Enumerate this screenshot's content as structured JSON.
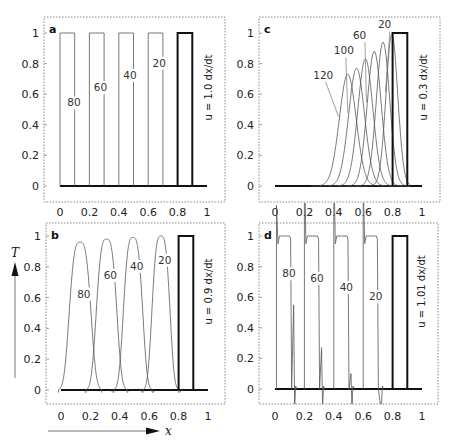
{
  "figure": {
    "y_axis_label": "T",
    "x_axis_label": "x"
  },
  "chart_data": [
    {
      "type": "line",
      "panel": "a",
      "title": "",
      "velocity_label": "u = 1.0 dx/dt",
      "xlabel": "x",
      "ylabel": "T",
      "xlim": [
        0,
        1
      ],
      "ylim": [
        -0.1,
        1.1
      ],
      "xticks": [
        0,
        0.2,
        0.4,
        0.6,
        0.8,
        1
      ],
      "yticks": [
        0,
        0.2,
        0.4,
        0.6,
        0.8,
        1
      ],
      "initial": {
        "shape": "box",
        "x0": 0.8,
        "x1": 0.9,
        "height": 1
      },
      "series": [
        {
          "name": "20",
          "shape": "box",
          "x0": 0.6,
          "x1": 0.7,
          "height": 1,
          "label_pos": [
            0.63,
            0.78
          ]
        },
        {
          "name": "40",
          "shape": "box",
          "x0": 0.4,
          "x1": 0.5,
          "height": 1,
          "label_pos": [
            0.43,
            0.7
          ]
        },
        {
          "name": "60",
          "shape": "box",
          "x0": 0.2,
          "x1": 0.3,
          "height": 1,
          "label_pos": [
            0.23,
            0.62
          ]
        },
        {
          "name": "80",
          "shape": "box",
          "x0": 0.0,
          "x1": 0.1,
          "height": 1,
          "label_pos": [
            0.05,
            0.52
          ]
        }
      ]
    },
    {
      "type": "line",
      "panel": "b",
      "velocity_label": "u = 0.9 dx/dt",
      "xlabel": "x",
      "ylabel": "T",
      "xlim": [
        0,
        1
      ],
      "ylim": [
        -0.1,
        1.1
      ],
      "xticks": [
        0,
        0.2,
        0.4,
        0.6,
        0.8,
        1
      ],
      "yticks": [
        0,
        0.2,
        0.4,
        0.6,
        0.8,
        1
      ],
      "initial": {
        "shape": "box",
        "x0": 0.8,
        "x1": 0.9,
        "height": 1
      },
      "series": [
        {
          "name": "20",
          "shape": "pulse",
          "center": 0.68,
          "width": 0.07,
          "height": 1.0,
          "label_pos": [
            0.66,
            0.82
          ]
        },
        {
          "name": "40",
          "shape": "pulse",
          "center": 0.49,
          "width": 0.075,
          "height": 0.99,
          "label_pos": [
            0.47,
            0.78
          ]
        },
        {
          "name": "60",
          "shape": "pulse",
          "center": 0.31,
          "width": 0.08,
          "height": 0.98,
          "label_pos": [
            0.29,
            0.72
          ]
        },
        {
          "name": "80",
          "shape": "pulse",
          "center": 0.13,
          "width": 0.085,
          "height": 0.96,
          "label_pos": [
            0.11,
            0.6
          ]
        }
      ]
    },
    {
      "type": "line",
      "panel": "c",
      "velocity_label": "u = 0.3 dx/dt",
      "xlabel": "x",
      "ylabel": "T",
      "xlim": [
        0,
        1
      ],
      "ylim": [
        -0.1,
        1.1
      ],
      "xticks": [
        0,
        0.2,
        0.4,
        0.6,
        0.8,
        1
      ],
      "yticks": [
        0,
        0.2,
        0.4,
        0.6,
        0.8,
        1
      ],
      "initial": {
        "shape": "box",
        "x0": 0.8,
        "x1": 0.9,
        "height": 1
      },
      "series": [
        {
          "name": "20",
          "shape": "gauss",
          "center": 0.795,
          "sigma": 0.04,
          "height": 0.99,
          "label_pos": [
            0.7,
            1.03
          ],
          "leader": true
        },
        {
          "name": "40",
          "shape": "gauss",
          "center": 0.735,
          "sigma": 0.045,
          "height": 0.94
        },
        {
          "name": "60",
          "shape": "gauss",
          "center": 0.675,
          "sigma": 0.048,
          "height": 0.88,
          "label_pos": [
            0.53,
            0.96
          ],
          "leader": true
        },
        {
          "name": "80",
          "shape": "gauss",
          "center": 0.615,
          "sigma": 0.051,
          "height": 0.83
        },
        {
          "name": "100",
          "shape": "gauss",
          "center": 0.555,
          "sigma": 0.054,
          "height": 0.77,
          "label_pos": [
            0.4,
            0.86
          ],
          "leader": true
        },
        {
          "name": "120",
          "shape": "gauss",
          "center": 0.495,
          "sigma": 0.057,
          "height": 0.73,
          "label_pos": [
            0.26,
            0.7
          ],
          "leader": true
        }
      ]
    },
    {
      "type": "line",
      "panel": "d",
      "velocity_label": "u = 1.01 dx/dt",
      "xlabel": "x",
      "ylabel": "T",
      "xlim": [
        0,
        1
      ],
      "ylim": [
        -0.1,
        1.1
      ],
      "xticks": [
        0,
        0.2,
        0.4,
        0.6,
        0.8,
        1
      ],
      "yticks": [
        0,
        0.2,
        0.4,
        0.6,
        0.8,
        1
      ],
      "initial": {
        "shape": "box",
        "x0": 0.8,
        "x1": 0.9,
        "height": 1
      },
      "series": [
        {
          "name": "20",
          "shape": "oscbox",
          "x0": 0.6,
          "x1": 0.71,
          "height": 1,
          "spike_up": 1.35,
          "spike_down": -0.1,
          "label_pos": [
            0.64,
            0.58
          ]
        },
        {
          "name": "40",
          "shape": "oscbox",
          "x0": 0.4,
          "x1": 0.51,
          "height": 1,
          "spike_up": 1.5,
          "spike_down": 0.1,
          "label_pos": [
            0.44,
            0.64
          ]
        },
        {
          "name": "60",
          "shape": "oscbox",
          "x0": 0.2,
          "x1": 0.31,
          "height": 1,
          "spike_up": 1.6,
          "spike_down": 0.27,
          "label_pos": [
            0.24,
            0.7
          ]
        },
        {
          "name": "80",
          "shape": "oscbox",
          "x0": 0.01,
          "x1": 0.12,
          "height": 1,
          "spike_up": 1.2,
          "spike_down": 0.55,
          "label_pos": [
            0.05,
            0.73
          ]
        }
      ]
    }
  ]
}
